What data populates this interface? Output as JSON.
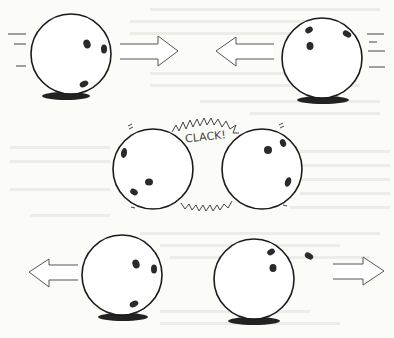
{
  "illustration": {
    "title": "",
    "caption": "",
    "sound_effect": "CLACK!",
    "background": "#fbfbf8",
    "panels": [
      {
        "name": "approach",
        "description": "Two balls roll toward each other",
        "balls": [
          {
            "id": "top-left",
            "direction": "right",
            "cx": 61,
            "cy": 50
          },
          {
            "id": "top-right",
            "direction": "left",
            "cx": 335,
            "cy": 53
          }
        ]
      },
      {
        "name": "collision",
        "description": "Balls collide",
        "balls": [
          {
            "id": "mid-left",
            "cx": 153,
            "cy": 178
          },
          {
            "id": "mid-right",
            "cx": 259,
            "cy": 178
          }
        ]
      },
      {
        "name": "rebound",
        "description": "Balls roll apart",
        "balls": [
          {
            "id": "bottom-left",
            "direction": "left",
            "cx": 118,
            "cy": 290
          },
          {
            "id": "bottom-right",
            "direction": "right",
            "cx": 253,
            "cy": 290
          }
        ]
      }
    ],
    "colors": {
      "ink": "#1a1a1a",
      "shadow": "#222222",
      "arrow_stroke": "#555555"
    }
  }
}
